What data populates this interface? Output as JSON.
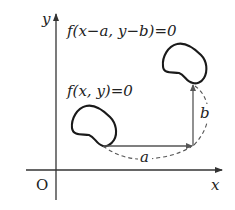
{
  "diagram": {
    "type": "coordinate-translation",
    "axes": {
      "x_label": "x",
      "y_label": "y",
      "origin_label": "O"
    },
    "curves": [
      {
        "id": "original",
        "equation": "f(x, y)=0"
      },
      {
        "id": "translated",
        "equation": "f(x−a, y−b)=0"
      }
    ],
    "translation": {
      "horizontal_label": "a",
      "vertical_label": "b"
    },
    "colors": {
      "stroke": "#222222",
      "background": "#ffffff"
    }
  }
}
